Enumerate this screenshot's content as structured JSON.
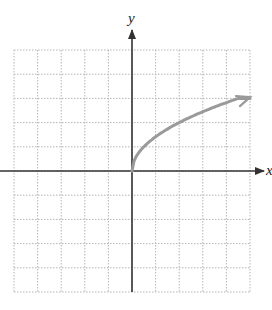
{
  "chart_data": {
    "type": "line",
    "title": "",
    "xlabel": "x",
    "ylabel": "y",
    "xlim": [
      -5,
      5
    ],
    "ylim": [
      -5,
      5
    ],
    "grid": true,
    "grid_style": "dotted",
    "tick_labels": false,
    "series": [
      {
        "name": "curve",
        "function": "y = sqrt(2x)",
        "color": "#9a9a9a",
        "start_point": [
          0,
          0
        ],
        "end_arrow": true,
        "x": [
          0,
          0.5,
          1,
          2,
          3,
          4,
          5
        ],
        "y": [
          0,
          1.0,
          1.41,
          2.0,
          2.45,
          2.83,
          3.16
        ]
      }
    ]
  },
  "labels": {
    "x_axis": "x",
    "y_axis": "y"
  },
  "colors": {
    "axis": "#333333",
    "grid": "#b5b5b5",
    "curve": "#9a9a9a"
  }
}
